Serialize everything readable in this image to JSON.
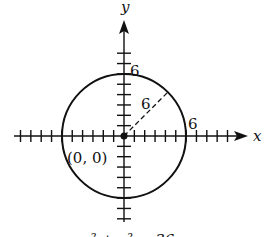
{
  "diagram": {
    "axes": {
      "x_label": "x",
      "y_label": "y"
    },
    "circle": {
      "center_label": "(0, 0)",
      "radius": 6
    },
    "labels": {
      "y_intercept": "6",
      "x_intercept": "6",
      "radius": "6"
    },
    "equation_partial": "x² + y² = 36",
    "ticks": {
      "x_min": -10,
      "x_max": 10,
      "y_min": -8,
      "y_max": 8
    }
  }
}
